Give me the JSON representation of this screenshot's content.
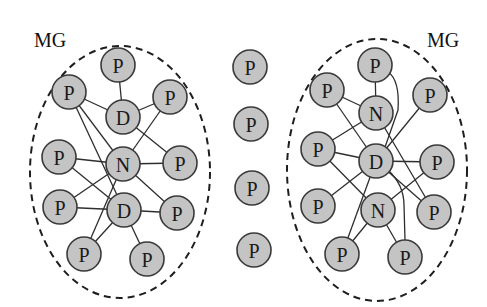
{
  "diagram": {
    "groups": [
      {
        "id": "left",
        "label": "MG",
        "cx": 120,
        "cy": 172,
        "rx": 90,
        "ry": 126,
        "label_x": 34,
        "label_y": 47
      },
      {
        "id": "right",
        "label": "MG",
        "cx": 377,
        "cy": 170,
        "rx": 90,
        "ry": 131,
        "label_x": 427,
        "label_y": 47
      }
    ],
    "nodes": [
      {
        "id": "L1",
        "label": "P",
        "x": 118,
        "y": 65
      },
      {
        "id": "L2",
        "label": "P",
        "x": 69,
        "y": 92
      },
      {
        "id": "L3",
        "label": "D",
        "x": 123,
        "y": 117
      },
      {
        "id": "L4",
        "label": "P",
        "x": 170,
        "y": 97
      },
      {
        "id": "L5",
        "label": "P",
        "x": 59,
        "y": 157
      },
      {
        "id": "L6",
        "label": "N",
        "x": 123,
        "y": 164
      },
      {
        "id": "L7",
        "label": "P",
        "x": 180,
        "y": 163
      },
      {
        "id": "L8",
        "label": "P",
        "x": 60,
        "y": 207
      },
      {
        "id": "L9",
        "label": "D",
        "x": 124,
        "y": 210
      },
      {
        "id": "L10",
        "label": "P",
        "x": 177,
        "y": 213
      },
      {
        "id": "L11",
        "label": "P",
        "x": 84,
        "y": 254
      },
      {
        "id": "L12",
        "label": "P",
        "x": 147,
        "y": 259
      },
      {
        "id": "M1",
        "label": "P",
        "x": 250,
        "y": 67
      },
      {
        "id": "M2",
        "label": "P",
        "x": 251,
        "y": 124
      },
      {
        "id": "M3",
        "label": "P",
        "x": 252,
        "y": 188
      },
      {
        "id": "M4",
        "label": "P",
        "x": 254,
        "y": 250
      },
      {
        "id": "R1",
        "label": "P",
        "x": 375,
        "y": 65
      },
      {
        "id": "R2",
        "label": "P",
        "x": 327,
        "y": 90
      },
      {
        "id": "R3",
        "label": "N",
        "x": 376,
        "y": 113
      },
      {
        "id": "R4",
        "label": "P",
        "x": 430,
        "y": 95
      },
      {
        "id": "R5",
        "label": "P",
        "x": 318,
        "y": 149
      },
      {
        "id": "R6",
        "label": "D",
        "x": 376,
        "y": 161
      },
      {
        "id": "R7",
        "label": "P",
        "x": 437,
        "y": 162
      },
      {
        "id": "R8",
        "label": "P",
        "x": 318,
        "y": 206
      },
      {
        "id": "R9",
        "label": "N",
        "x": 378,
        "y": 210
      },
      {
        "id": "R10",
        "label": "P",
        "x": 434,
        "y": 212
      },
      {
        "id": "R11",
        "label": "P",
        "x": 342,
        "y": 254
      },
      {
        "id": "R12",
        "label": "P",
        "x": 405,
        "y": 257
      }
    ],
    "edges": [
      [
        "L1",
        "L3"
      ],
      [
        "L2",
        "L3"
      ],
      [
        "L4",
        "L3"
      ],
      [
        "L2",
        "L6"
      ],
      [
        "L2",
        "L9"
      ],
      [
        "L3",
        "L7"
      ],
      [
        "L4",
        "L6"
      ],
      [
        "L5",
        "L6"
      ],
      [
        "L5",
        "L9"
      ],
      [
        "L6",
        "L7"
      ],
      [
        "L6",
        "L8"
      ],
      [
        "L6",
        "L10"
      ],
      [
        "L6",
        "L11"
      ],
      [
        "L8",
        "L9"
      ],
      [
        "L9",
        "L10"
      ],
      [
        "L9",
        "L11"
      ],
      [
        "L9",
        "L12"
      ],
      [
        "R1",
        "R3"
      ],
      [
        "R2",
        "R3"
      ],
      [
        "R2",
        "R6"
      ],
      [
        "R3",
        "R5"
      ],
      [
        "R3",
        "R10"
      ],
      [
        "R4",
        "R6"
      ],
      [
        "R5",
        "R6"
      ],
      [
        "R5",
        "R9"
      ],
      [
        "R6",
        "R7"
      ],
      [
        "R6",
        "R8"
      ],
      [
        "R6",
        "R10"
      ],
      [
        "R6",
        "R11"
      ],
      [
        "R7",
        "R9"
      ],
      [
        "R9",
        "R11"
      ],
      [
        "R9",
        "R12"
      ]
    ],
    "curved_edges": [
      {
        "from": "R1",
        "to": "R6",
        "path": "M 388 72 Q 400 80 398 110 L 384 150"
      },
      {
        "from": "R6",
        "to": "R12",
        "path": "M 388 170 Q 404 185 404 205 L 405 240"
      }
    ],
    "node_radius": 17
  }
}
